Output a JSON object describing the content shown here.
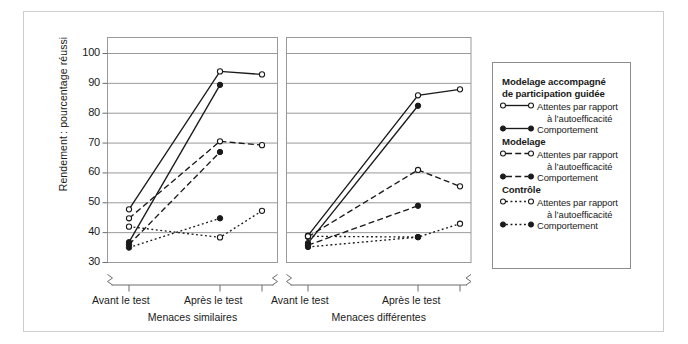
{
  "figure": {
    "ylabel": "Rendement : pourcentage réussi",
    "yticks": [
      "100",
      "90",
      "80",
      "70",
      "60",
      "50",
      "40",
      "30"
    ],
    "panels": [
      {
        "name": "Menaces similaires",
        "xticks": [
          "Avant le test",
          "Après le test"
        ]
      },
      {
        "name": "Menaces différentes",
        "xticks": [
          "Avant le test",
          "Après le test"
        ]
      }
    ]
  },
  "legend": {
    "groups": [
      {
        "title_line1": "Modelage accompagné",
        "title_line2": "de participation guidée",
        "entries": [
          {
            "marker": "open",
            "style": "solid",
            "label_line1": "Attentes par rapport",
            "label_line2": "à l’autoefficacité"
          },
          {
            "marker": "filled",
            "style": "solid",
            "label_line1": "Comportement",
            "label_line2": ""
          }
        ]
      },
      {
        "title_line1": "Modelage",
        "title_line2": "",
        "entries": [
          {
            "marker": "open",
            "style": "dashed",
            "label_line1": "Attentes par rapport",
            "label_line2": "à l’autoefficacité"
          },
          {
            "marker": "filled",
            "style": "dashed",
            "label_line1": "Comportement",
            "label_line2": ""
          }
        ]
      },
      {
        "title_line1": "Contrôle",
        "title_line2": "",
        "entries": [
          {
            "marker": "open",
            "style": "dotted",
            "label_line1": "Attentes par rapport",
            "label_line2": "à l’autoefficacité"
          },
          {
            "marker": "filled",
            "style": "dotted",
            "label_line1": "Comportement",
            "label_line2": ""
          }
        ]
      }
    ]
  },
  "colors": {
    "line": "#1a1a1a",
    "grid": "#9a9a9a",
    "axis": "#6d6d6d",
    "outer_border": "#cdcdcd",
    "legend_border": "#8c8c8c",
    "background": "#ffffff"
  },
  "chart_data": {
    "type": "line",
    "title": "",
    "xlabel": "",
    "ylabel": "Rendement : pourcentage réussi",
    "ylim": [
      28,
      104
    ],
    "yticks": [
      30,
      40,
      50,
      60,
      70,
      80,
      90,
      100
    ],
    "grid": true,
    "legend_position": "right",
    "panels": [
      {
        "name": "Menaces similaires",
        "x": [
          "Avant le test",
          "Après le test",
          "Suivi"
        ],
        "series": [
          {
            "name": "Modelage accompagné de participation guidée — Attentes par rapport à l’autoefficacité",
            "group": "Modelage accompagné de participation guidée",
            "measure": "Attentes par rapport à l’autoefficacité",
            "marker": "open",
            "style": "solid",
            "values": [
              47.8,
              94.0,
              93.0
            ]
          },
          {
            "name": "Modelage accompagné de participation guidée — Comportement",
            "group": "Modelage accompagné de participation guidée",
            "measure": "Comportement",
            "marker": "filled",
            "style": "solid",
            "values": [
              36.8,
              89.5,
              null
            ]
          },
          {
            "name": "Modelage — Attentes par rapport à l’autoefficacité",
            "group": "Modelage",
            "measure": "Attentes par rapport à l’autoefficacité",
            "marker": "open",
            "style": "dashed",
            "values": [
              44.8,
              70.6,
              69.3
            ]
          },
          {
            "name": "Modelage — Comportement",
            "group": "Modelage",
            "measure": "Comportement",
            "marker": "filled",
            "style": "dashed",
            "values": [
              36.0,
              67.0,
              null
            ]
          },
          {
            "name": "Contrôle — Attentes par rapport à l’autoefficacité",
            "group": "Contrôle",
            "measure": "Attentes par rapport à l’autoefficacité",
            "marker": "open",
            "style": "dotted",
            "values": [
              42.0,
              38.4,
              47.3
            ]
          },
          {
            "name": "Contrôle — Comportement",
            "group": "Contrôle",
            "measure": "Comportement",
            "marker": "filled",
            "style": "dotted",
            "values": [
              35.0,
              44.8,
              null
            ]
          }
        ]
      },
      {
        "name": "Menaces différentes",
        "x": [
          "Avant le test",
          "Après le test",
          "Suivi"
        ],
        "series": [
          {
            "name": "Modelage accompagné de participation guidée — Attentes par rapport à l’autoefficacité",
            "group": "Modelage accompagné de participation guidée",
            "measure": "Attentes par rapport à l’autoefficacité",
            "marker": "open",
            "style": "solid",
            "values": [
              39.0,
              86.0,
              88.0
            ]
          },
          {
            "name": "Modelage accompagné de participation guidée — Comportement",
            "group": "Modelage accompagné de participation guidée",
            "measure": "Comportement",
            "marker": "filled",
            "style": "solid",
            "values": [
              36.5,
              82.5,
              null
            ]
          },
          {
            "name": "Modelage — Attentes par rapport à l’autoefficacité",
            "group": "Modelage",
            "measure": "Attentes par rapport à l’autoefficacité",
            "marker": "open",
            "style": "dashed",
            "values": [
              38.6,
              61.0,
              55.5
            ]
          },
          {
            "name": "Modelage — Comportement",
            "group": "Modelage",
            "measure": "Comportement",
            "marker": "filled",
            "style": "dashed",
            "values": [
              35.8,
              49.0,
              null
            ]
          },
          {
            "name": "Contrôle — Attentes par rapport à l’autoefficacité",
            "group": "Contrôle",
            "measure": "Attentes par rapport à l’autoefficacité",
            "marker": "open",
            "style": "dotted",
            "values": [
              38.8,
              38.5,
              43.0
            ]
          },
          {
            "name": "Contrôle — Comportement",
            "group": "Contrôle",
            "measure": "Comportement",
            "marker": "filled",
            "style": "dotted",
            "values": [
              35.2,
              38.5,
              null
            ]
          }
        ]
      }
    ]
  }
}
